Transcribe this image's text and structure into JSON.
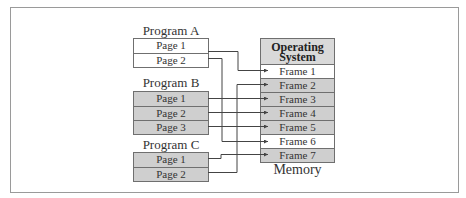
{
  "diagram": {
    "programs": [
      {
        "name": "Program A",
        "shaded": false,
        "pages": [
          "Page 1",
          "Page 2"
        ]
      },
      {
        "name": "Program B",
        "shaded": true,
        "pages": [
          "Page 1",
          "Page 2",
          "Page 3"
        ]
      },
      {
        "name": "Program C",
        "shaded": true,
        "pages": [
          "Page 1",
          "Page 2"
        ]
      }
    ],
    "memory": {
      "label": "Memory",
      "os_label_line1": "Operating",
      "os_label_line2": "System",
      "frames": [
        {
          "label": "Frame 1",
          "shaded": false
        },
        {
          "label": "Frame 2",
          "shaded": true
        },
        {
          "label": "Frame 3",
          "shaded": true
        },
        {
          "label": "Frame 4",
          "shaded": true
        },
        {
          "label": "Frame 5",
          "shaded": true
        },
        {
          "label": "Frame 6",
          "shaded": false
        },
        {
          "label": "Frame 7",
          "shaded": true
        }
      ]
    },
    "mappings": [
      {
        "program": "Program A",
        "page": "Page 1",
        "frame": "Frame 1"
      },
      {
        "program": "Program A",
        "page": "Page 2",
        "frame": "Frame 6"
      },
      {
        "program": "Program B",
        "page": "Page 1",
        "frame": "Frame 3"
      },
      {
        "program": "Program B",
        "page": "Page 2",
        "frame": "Frame 4"
      },
      {
        "program": "Program B",
        "page": "Page 3",
        "frame": "Frame 5"
      },
      {
        "program": "Program C",
        "page": "Page 1",
        "frame": "Frame 7"
      },
      {
        "program": "Program C",
        "page": "Page 2",
        "frame": "Frame 2"
      }
    ],
    "colors": {
      "shaded": "#cfcfcf",
      "border": "#6f6f6f",
      "line": "#444444"
    }
  }
}
